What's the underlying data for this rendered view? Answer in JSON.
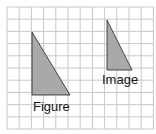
{
  "diagram": {
    "grid": {
      "cols": 12,
      "rows": 10,
      "x0": 7,
      "y0": 7,
      "cell": 12.2,
      "line_color": "#c8c8c8"
    },
    "shapes": [
      {
        "name": "figure",
        "label": "Figure",
        "points": "32,32 32,95 70,95",
        "fill": "#a9a9a9",
        "stroke": "#222222",
        "label_x": 33,
        "label_y": 111
      },
      {
        "name": "image",
        "label": "Image",
        "points": "107,20 107,70 132,70",
        "fill": "#a9a9a9",
        "stroke": "#222222",
        "label_x": 102,
        "label_y": 84
      }
    ]
  }
}
